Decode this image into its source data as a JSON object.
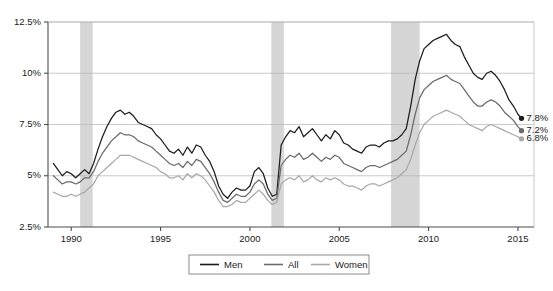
{
  "chart_data": {
    "type": "line",
    "title": "",
    "subtitle": "",
    "xlabel": "",
    "ylabel": "",
    "xlim": [
      1988.7,
      2015.9
    ],
    "ylim": [
      2.5,
      12.5
    ],
    "grid": true,
    "legend_position": "bottom-center",
    "y_ticks": [
      "2.5%",
      "5%",
      "7.5%",
      "10%",
      "12.5%"
    ],
    "y_tick_values": [
      2.5,
      5,
      7.5,
      10,
      12.5
    ],
    "x_ticks": [
      "1990",
      "1995",
      "2000",
      "2005",
      "2010",
      "2015"
    ],
    "x_tick_values": [
      1990,
      1995,
      2000,
      2005,
      2010,
      2015
    ],
    "colors": {
      "men": "#1c1c1c",
      "all": "#6b6b6b",
      "women": "#a8a8a8",
      "recession_band": "#d6d6d6",
      "gridline": "#b5b5b5",
      "axis": "#4d4d4d"
    },
    "recession_bands": [
      {
        "start": 1990.5,
        "end": 1991.2
      },
      {
        "start": 2001.2,
        "end": 2001.9
      },
      {
        "start": 2007.9,
        "end": 2009.5
      }
    ],
    "end_labels": [
      {
        "series": "Men",
        "value": 7.8,
        "text": "7.8%"
      },
      {
        "series": "All",
        "value": 7.2,
        "text": "7.2%"
      },
      {
        "series": "Women",
        "value": 6.8,
        "text": "6.8%"
      }
    ],
    "x": [
      1989.0,
      1989.25,
      1989.5,
      1989.75,
      1990.0,
      1990.25,
      1990.5,
      1990.75,
      1991.0,
      1991.25,
      1991.5,
      1991.75,
      1992.0,
      1992.25,
      1992.5,
      1992.75,
      1993.0,
      1993.25,
      1993.5,
      1993.75,
      1994.0,
      1994.25,
      1994.5,
      1994.75,
      1995.0,
      1995.25,
      1995.5,
      1995.75,
      1996.0,
      1996.25,
      1996.5,
      1996.75,
      1997.0,
      1997.25,
      1997.5,
      1997.75,
      1998.0,
      1998.25,
      1998.5,
      1998.75,
      1999.0,
      1999.25,
      1999.5,
      1999.75,
      2000.0,
      2000.25,
      2000.5,
      2000.75,
      2001.0,
      2001.25,
      2001.5,
      2001.75,
      2002.0,
      2002.25,
      2002.5,
      2002.75,
      2003.0,
      2003.25,
      2003.5,
      2003.75,
      2004.0,
      2004.25,
      2004.5,
      2004.75,
      2005.0,
      2005.25,
      2005.5,
      2005.75,
      2006.0,
      2006.25,
      2006.5,
      2006.75,
      2007.0,
      2007.25,
      2007.5,
      2007.75,
      2008.0,
      2008.25,
      2008.5,
      2008.75,
      2009.0,
      2009.25,
      2009.5,
      2009.75,
      2010.0,
      2010.25,
      2010.5,
      2010.75,
      2011.0,
      2011.25,
      2011.5,
      2011.75,
      2012.0,
      2012.25,
      2012.5,
      2012.75,
      2013.0,
      2013.25,
      2013.5,
      2013.75,
      2014.0,
      2014.25,
      2014.5,
      2014.75,
      2015.0,
      2015.2
    ],
    "series": [
      {
        "name": "Men",
        "color": "#1c1c1c",
        "values": [
          5.6,
          5.3,
          5.0,
          5.2,
          5.1,
          4.9,
          5.1,
          5.3,
          5.1,
          5.6,
          6.3,
          6.9,
          7.4,
          7.8,
          8.1,
          8.2,
          8.0,
          8.1,
          7.9,
          7.6,
          7.5,
          7.4,
          7.3,
          7.0,
          6.8,
          6.5,
          6.2,
          6.1,
          6.3,
          6.0,
          6.4,
          6.1,
          6.5,
          6.4,
          6.0,
          5.7,
          5.2,
          4.5,
          4.1,
          3.9,
          4.2,
          4.4,
          4.3,
          4.3,
          4.5,
          5.2,
          5.4,
          5.1,
          4.4,
          4.0,
          4.1,
          6.5,
          6.9,
          7.2,
          7.1,
          7.4,
          6.9,
          7.1,
          7.3,
          7.0,
          6.7,
          7.0,
          6.8,
          7.2,
          7.0,
          6.6,
          6.5,
          6.3,
          6.2,
          6.1,
          6.4,
          6.5,
          6.5,
          6.4,
          6.6,
          6.7,
          6.7,
          6.8,
          7.0,
          7.3,
          8.4,
          9.7,
          10.6,
          11.2,
          11.4,
          11.6,
          11.7,
          11.8,
          11.9,
          11.6,
          11.4,
          11.3,
          10.8,
          10.4,
          10.0,
          9.8,
          9.7,
          10.0,
          10.1,
          9.9,
          9.6,
          9.2,
          8.7,
          8.4,
          8.0,
          7.8
        ]
      },
      {
        "name": "All",
        "color": "#6b6b6b",
        "values": [
          5.0,
          4.8,
          4.6,
          4.7,
          4.7,
          4.6,
          4.7,
          4.9,
          4.9,
          5.2,
          5.7,
          6.1,
          6.4,
          6.7,
          6.9,
          7.1,
          7.0,
          7.0,
          6.9,
          6.7,
          6.6,
          6.5,
          6.4,
          6.2,
          6.0,
          5.8,
          5.6,
          5.5,
          5.6,
          5.4,
          5.7,
          5.5,
          5.8,
          5.7,
          5.4,
          5.1,
          4.7,
          4.2,
          3.8,
          3.7,
          3.9,
          4.1,
          4.0,
          4.0,
          4.2,
          4.6,
          4.8,
          4.6,
          4.1,
          3.8,
          3.9,
          5.5,
          5.8,
          6.0,
          5.9,
          6.1,
          5.8,
          5.9,
          6.1,
          5.9,
          5.7,
          5.9,
          5.8,
          6.0,
          5.9,
          5.6,
          5.5,
          5.4,
          5.3,
          5.2,
          5.4,
          5.5,
          5.5,
          5.4,
          5.5,
          5.6,
          5.7,
          5.8,
          6.0,
          6.2,
          7.0,
          8.0,
          8.8,
          9.2,
          9.4,
          9.6,
          9.7,
          9.8,
          9.9,
          9.7,
          9.6,
          9.5,
          9.2,
          8.9,
          8.6,
          8.4,
          8.4,
          8.6,
          8.7,
          8.6,
          8.4,
          8.1,
          7.9,
          7.7,
          7.4,
          7.2
        ]
      },
      {
        "name": "Women",
        "color": "#a8a8a8",
        "values": [
          4.2,
          4.1,
          4.0,
          4.0,
          4.1,
          4.0,
          4.1,
          4.2,
          4.4,
          4.6,
          5.0,
          5.2,
          5.4,
          5.6,
          5.8,
          6.0,
          6.0,
          6.0,
          5.9,
          5.8,
          5.7,
          5.6,
          5.5,
          5.4,
          5.2,
          5.1,
          4.9,
          4.9,
          5.0,
          4.8,
          5.1,
          4.9,
          5.1,
          5.0,
          4.8,
          4.5,
          4.2,
          3.8,
          3.5,
          3.5,
          3.6,
          3.8,
          3.7,
          3.7,
          3.9,
          4.1,
          4.3,
          4.1,
          3.8,
          3.6,
          3.7,
          4.6,
          4.8,
          4.9,
          4.8,
          5.0,
          4.7,
          4.8,
          5.0,
          4.8,
          4.7,
          4.9,
          4.8,
          4.9,
          4.8,
          4.6,
          4.5,
          4.5,
          4.4,
          4.3,
          4.5,
          4.6,
          4.6,
          4.5,
          4.6,
          4.7,
          4.8,
          4.9,
          5.1,
          5.3,
          5.8,
          6.5,
          7.1,
          7.5,
          7.7,
          7.9,
          8.0,
          8.1,
          8.2,
          8.1,
          8.0,
          7.9,
          7.7,
          7.5,
          7.4,
          7.3,
          7.2,
          7.4,
          7.5,
          7.4,
          7.3,
          7.2,
          7.1,
          7.0,
          6.9,
          6.8
        ]
      }
    ]
  },
  "legend": {
    "items": [
      {
        "label": "Men",
        "color": "#1c1c1c"
      },
      {
        "label": "All",
        "color": "#6b6b6b"
      },
      {
        "label": "Women",
        "color": "#a8a8a8"
      }
    ]
  },
  "axes": {
    "y_labels": [
      "12.5%",
      "10%",
      "7.5%",
      "5%",
      "2.5%"
    ],
    "x_labels": [
      "1990",
      "1995",
      "2000",
      "2005",
      "2010",
      "2015"
    ]
  },
  "end_labels": {
    "men": "7.8%",
    "all": "7.2%",
    "women": "6.8%"
  }
}
